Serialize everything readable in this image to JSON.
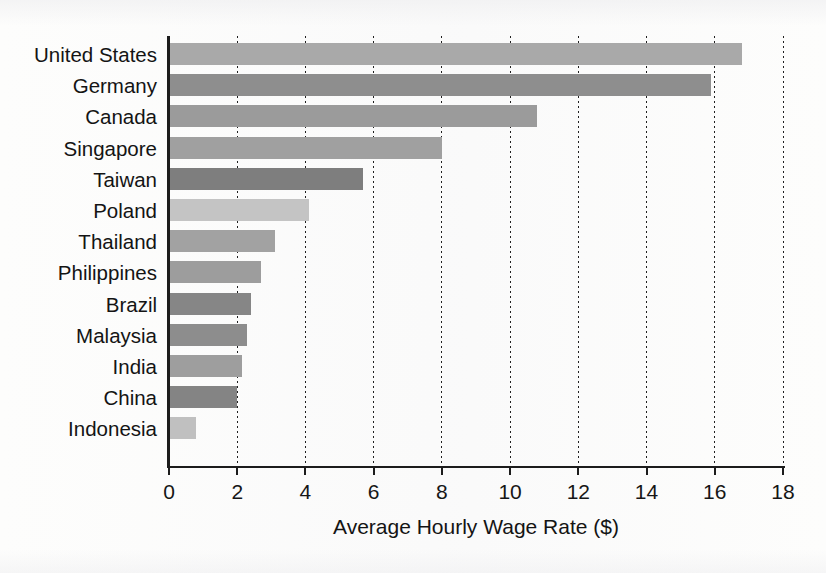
{
  "chart_data": {
    "type": "bar",
    "orientation": "horizontal",
    "title": "",
    "xlabel": "Average Hourly Wage Rate ($)",
    "ylabel": "",
    "xlim": [
      0,
      18
    ],
    "xticks": [
      "0",
      "2",
      "4",
      "6",
      "8",
      "10",
      "12",
      "14",
      "16",
      "18"
    ],
    "xtick_values": [
      0,
      2,
      4,
      6,
      8,
      10,
      12,
      14,
      16,
      18
    ],
    "grid": "vertical-dotted",
    "legend": "none",
    "categories": [
      "United States",
      "Germany",
      "Canada",
      "Singapore",
      "Taiwan",
      "Poland",
      "Thailand",
      "Philippines",
      "Brazil",
      "Malaysia",
      "India",
      "China",
      "Indonesia"
    ],
    "values": [
      16.8,
      15.9,
      10.8,
      8.0,
      5.7,
      4.1,
      3.1,
      2.7,
      2.4,
      2.3,
      2.15,
      2.0,
      0.8
    ],
    "bar_colors": [
      "#a9a9a9",
      "#8e8e8e",
      "#9b9b9b",
      "#a0a0a0",
      "#7e7e7e",
      "#c4c4c4",
      "#a2a2a2",
      "#9d9d9d",
      "#868686",
      "#8d8d8d",
      "#9e9e9e",
      "#848484",
      "#c0c0c0"
    ]
  },
  "axis": {
    "line_color": "#1c1c1c",
    "gridline_color": "#1f1f1f"
  },
  "page": {
    "background": "#fdfdfc"
  }
}
